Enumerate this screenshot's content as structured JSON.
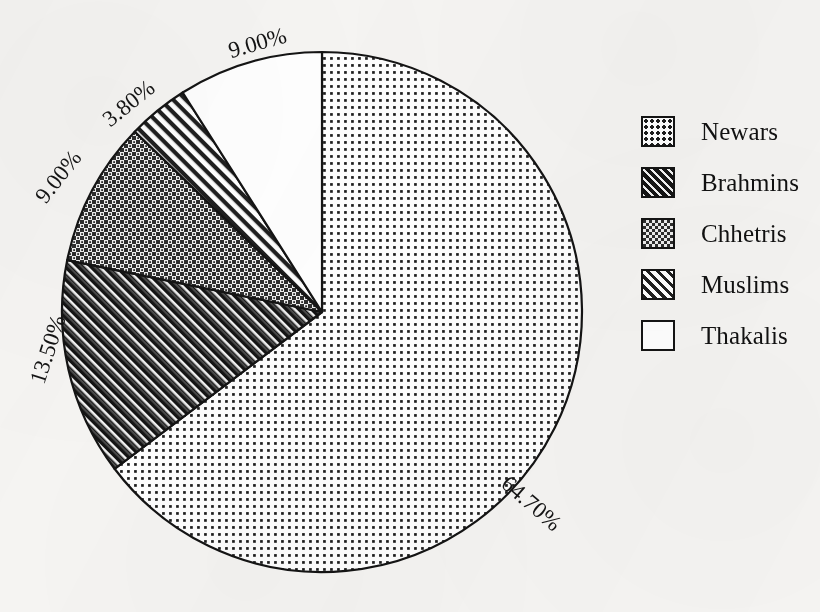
{
  "chart_data": {
    "type": "pie",
    "title": "",
    "subtitle": "",
    "xlabel": "",
    "ylabel": "",
    "grid": false,
    "legend_position": "right",
    "units": "percent",
    "start_angle_deg": 0,
    "direction": "clockwise",
    "categories": [
      "Newars",
      "Brahmins",
      "Chhetris",
      "Muslims",
      "Thakalis"
    ],
    "values": [
      64.7,
      13.5,
      9.0,
      3.8,
      9.0
    ],
    "labels": [
      "64.70%",
      "13.50%",
      "9.00%",
      "3.80%",
      "9.00%"
    ],
    "slices": [
      {
        "name": "Newars",
        "value": 64.7,
        "label": "64.70%",
        "pattern": "fine-dot-grid-on-white",
        "fill_hex": "#ffffff",
        "ink_hex": "#1a1a1a",
        "label_x": 530,
        "label_y": 505,
        "label_rotation": 41
      },
      {
        "name": "Brahmins",
        "value": 13.5,
        "label": "13.50%",
        "pattern": "black-with-white-diagonal-hatch",
        "fill_hex": "#171717",
        "ink_hex": "#ffffff",
        "label_x": 50,
        "label_y": 350,
        "label_rotation": -72
      },
      {
        "name": "Chhetris",
        "value": 9.0,
        "label": "9.00%",
        "pattern": "dark-checkerboard",
        "fill_hex": "#3a3a3a",
        "ink_hex": "#ffffff",
        "label_x": 60,
        "label_y": 178,
        "label_rotation": -52
      },
      {
        "name": "Muslims",
        "value": 3.8,
        "label": "3.80%",
        "pattern": "white-with-dark-diagonal-hatch",
        "fill_hex": "#ffffff",
        "ink_hex": "#1a1a1a",
        "label_x": 130,
        "label_y": 105,
        "label_rotation": -39
      },
      {
        "name": "Thakalis",
        "value": 9.0,
        "label": "9.00%",
        "pattern": "solid-white",
        "fill_hex": "#ffffff",
        "ink_hex": "#1a1a1a",
        "label_x": 258,
        "label_y": 45,
        "label_rotation": -16
      }
    ],
    "geometry": {
      "center_x": 322,
      "center_y": 312,
      "radius": 260,
      "outline_hex": "#141414"
    }
  },
  "legend": {
    "items": [
      {
        "label": "Newars",
        "swatch": "swatch-dot-grid"
      },
      {
        "label": "Brahmins",
        "swatch": "swatch-black-hatch"
      },
      {
        "label": "Chhetris",
        "swatch": "swatch-checker"
      },
      {
        "label": "Muslims",
        "swatch": "swatch-white-hatch"
      },
      {
        "label": "Thakalis",
        "swatch": "swatch-white"
      }
    ]
  },
  "colors": {
    "background": "#f6f5f3",
    "ink": "#141414",
    "paper": "#ffffff"
  }
}
